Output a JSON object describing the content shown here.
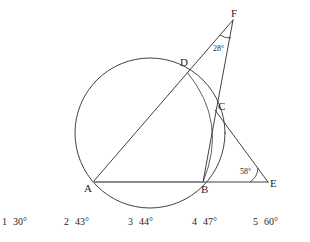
{
  "figure": {
    "type": "circle-geometry-diagram",
    "points": [
      {
        "name": "A",
        "label": "A",
        "x": 93,
        "y": 182,
        "label_x": 84,
        "label_y": 183
      },
      {
        "name": "B",
        "label": "B",
        "x": 203,
        "y": 182,
        "label_x": 201,
        "label_y": 184
      },
      {
        "name": "C",
        "label": "C",
        "x": 215,
        "y": 110,
        "label_x": 218,
        "label_y": 101
      },
      {
        "name": "D",
        "label": "D",
        "x": 187,
        "y": 72,
        "label_x": 180,
        "label_y": 57
      },
      {
        "name": "E",
        "label": "E",
        "x": 268,
        "y": 182,
        "label_x": 270,
        "label_y": 178
      },
      {
        "name": "F",
        "label": "F",
        "x": 233,
        "y": 20,
        "label_x": 231,
        "label_y": 8
      }
    ],
    "circle": {
      "cx": 150,
      "cy": 133,
      "r": 75
    },
    "arc_through_D_C_B": {
      "start": "D",
      "mid": "C",
      "end": "B"
    },
    "segments": [
      {
        "name": "segment-AF",
        "from": "A",
        "to": "F",
        "style": "thin"
      },
      {
        "name": "segment-BF",
        "from": "B",
        "to": "F",
        "style": "thin"
      },
      {
        "name": "segment-AE",
        "from": "A",
        "to": "E",
        "style": "highlight"
      },
      {
        "name": "segment-BE",
        "from": "B",
        "to": "E",
        "style": "thin"
      },
      {
        "name": "segment-CE",
        "from": "C",
        "to": "E",
        "style": "thin"
      }
    ],
    "angles": [
      {
        "name": "angle-at-F",
        "vertex": "F",
        "value": "28°",
        "label_x": 213,
        "label_y": 45
      },
      {
        "name": "angle-at-E",
        "vertex": "E",
        "value": "58°",
        "label_x": 240,
        "label_y": 168
      }
    ]
  },
  "answers": {
    "options": [
      {
        "num": "1",
        "value": "30°",
        "x": 2
      },
      {
        "num": "2",
        "value": "43°",
        "x": 64
      },
      {
        "num": "3",
        "value": "44°",
        "x": 128
      },
      {
        "num": "4",
        "value": "47°",
        "x": 192
      },
      {
        "num": "5",
        "value": "60°",
        "x": 253
      }
    ]
  }
}
